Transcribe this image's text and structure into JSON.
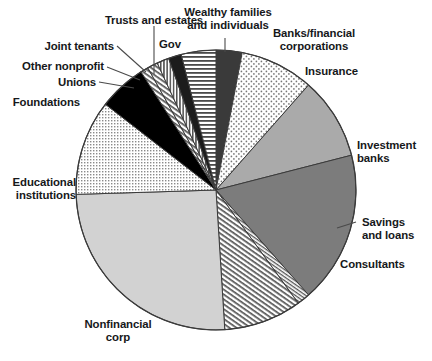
{
  "chart_data": {
    "type": "pie",
    "title": "",
    "subtitle": "",
    "xlabel": "",
    "ylabel": "",
    "legend_position": "none",
    "grid": false,
    "start_angle_deg": 0,
    "direction": "clockwise",
    "center": {
      "x": 216,
      "y": 190
    },
    "radius": 140,
    "categories": [
      "Wealthy families and individuals",
      "Banks/financial corporations",
      "Insurance",
      "Investment banks",
      "Savings and loans",
      "Consultants",
      "Nonfinancial corp",
      "Educational institutions",
      "Foundations",
      "Unions",
      "Other nonprofit",
      "Joint tenants",
      "Trusts and estates",
      "Gov"
    ],
    "values": [
      3.0,
      8.5,
      9.5,
      17.5,
      1.5,
      9.0,
      25.5,
      11.0,
      5.5,
      0.9,
      1.2,
      1.4,
      1.5,
      4.0
    ],
    "units": "percent",
    "slices": [
      {
        "label": "Wealthy families and individuals",
        "value": 3.0,
        "fill": "#3a3a3a",
        "pattern": "solid-dark"
      },
      {
        "label": "Banks/financial corporations",
        "value": 8.5,
        "fill": "#f2f2f2",
        "pattern": "dots-sparse"
      },
      {
        "label": "Insurance",
        "value": 9.5,
        "fill": "#aaaaaa",
        "pattern": "solid"
      },
      {
        "label": "Investment banks",
        "value": 17.5,
        "fill": "#7c7c7c",
        "pattern": "solid"
      },
      {
        "label": "Savings and loans",
        "value": 1.5,
        "fill": "#ffffff",
        "pattern": "hatch-diagonal-fine"
      },
      {
        "label": "Consultants",
        "value": 9.0,
        "fill": "#ffffff",
        "pattern": "hatch-diagonal"
      },
      {
        "label": "Nonfinancial corp",
        "value": 25.5,
        "fill": "#d2d2d2",
        "pattern": "solid"
      },
      {
        "label": "Educational institutions",
        "value": 11.0,
        "fill": "#ffffff",
        "pattern": "grid-dots"
      },
      {
        "label": "Foundations",
        "value": 5.5,
        "fill": "#000000",
        "pattern": "solid-black"
      },
      {
        "label": "Unions",
        "value": 0.9,
        "fill": "#ffffff",
        "pattern": "hatch-diagonal"
      },
      {
        "label": "Other nonprofit",
        "value": 1.2,
        "fill": "#ffffff",
        "pattern": "hatch-diagonal"
      },
      {
        "label": "Joint tenants",
        "value": 1.4,
        "fill": "#ffffff",
        "pattern": "hatch-vertical"
      },
      {
        "label": "Trusts and estates",
        "value": 1.5,
        "fill": "#1c1c1c",
        "pattern": "solid-black"
      },
      {
        "label": "Gov",
        "value": 4.0,
        "fill": "#ffffff",
        "pattern": "hatch-horizontal"
      }
    ]
  },
  "labels": {
    "trusts_and_estates": "Trusts and estates",
    "wealthy_families": "Wealthy families\nand individuals",
    "gov": "Gov",
    "banks_financial": "Banks/financial\ncorporations",
    "insurance": "Insurance",
    "investment_banks": "Investment\nbanks",
    "savings_and_loans": "Savings\nand loans",
    "consultants": "Consultants",
    "nonfinancial_corp": "Nonfinancial\ncorp",
    "educational_institutions": "Educational\ninstitutions",
    "foundations": "Foundations",
    "unions": "Unions",
    "other_nonprofit": "Other nonprofit",
    "joint_tenants": "Joint tenants"
  },
  "colors": {
    "background": "#ffffff",
    "text": "#16181a",
    "outline": "#3b3b3b",
    "leader_line": "#4a4a4a",
    "black_slice": "#000000",
    "dark_slice": "#3a3a3a",
    "mid_gray_slice": "#aaaaaa",
    "dark_gray_slice": "#7c7c7c",
    "light_gray_slice": "#d2d2d2"
  }
}
